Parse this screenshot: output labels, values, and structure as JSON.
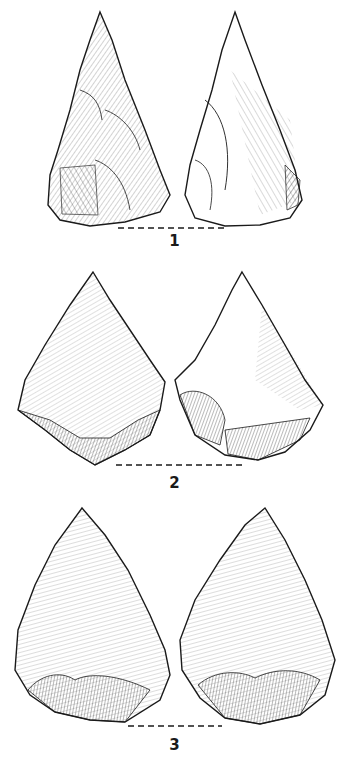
{
  "plate": {
    "description": "Three stone points, each shown in two views (dorsal and ventral), with dashed line marking the base/platform",
    "ink_color": "#1a1a1a",
    "background": "#ffffff"
  },
  "figures": [
    {
      "label": "1",
      "view_left": "dorsal-face",
      "view_right": "ventral-face",
      "shape": "elongated-triangular-point"
    },
    {
      "label": "2",
      "view_left": "dorsal-face",
      "view_right": "ventral-face",
      "shape": "broad-pentagonal-point"
    },
    {
      "label": "3",
      "view_left": "dorsal-face",
      "view_right": "ventral-face",
      "shape": "ovate-triangular-biface"
    }
  ]
}
